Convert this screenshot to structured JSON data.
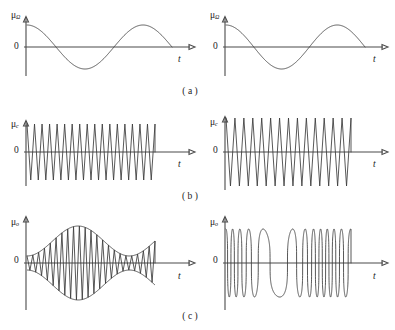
{
  "figure": {
    "width": 395,
    "height": 330,
    "background_color": "#ffffff",
    "line_color": "#3a3a3a",
    "axis_color": "#4a4a4a"
  },
  "labels": {
    "mu_base": "μ",
    "mu_sub_modulating": "Ω",
    "mu_sub_carrier": "c",
    "mu_sub_output": "o",
    "zero": "0",
    "time_axis": "t"
  },
  "rows": [
    {
      "key": "a",
      "caption": "( a )",
      "description": "modulating signal"
    },
    {
      "key": "b",
      "caption": "( b )",
      "description": "carrier signal"
    },
    {
      "key": "c",
      "caption": "( c )",
      "description": "modulated output signal"
    }
  ],
  "panels": [
    {
      "id": "a-left",
      "row": "a",
      "column": "left",
      "mu_label": "μ",
      "mu_subscript": "Ω",
      "zero_label": "0",
      "t_label": "t"
    },
    {
      "id": "a-right",
      "row": "a",
      "column": "right",
      "mu_label": "μ",
      "mu_subscript": "Ω",
      "zero_label": "0",
      "t_label": "t"
    },
    {
      "id": "b-left",
      "row": "b",
      "column": "left",
      "mu_label": "μ",
      "mu_subscript": "c",
      "zero_label": "0",
      "t_label": "t"
    },
    {
      "id": "b-right",
      "row": "b",
      "column": "right",
      "mu_label": "μ",
      "mu_subscript": "c",
      "zero_label": "0",
      "t_label": "t"
    },
    {
      "id": "c-left",
      "row": "c",
      "column": "left",
      "mu_label": "μ",
      "mu_subscript": "o",
      "zero_label": "0",
      "t_label": "t"
    },
    {
      "id": "c-right",
      "row": "c",
      "column": "right",
      "mu_label": "μ",
      "mu_subscript": "o",
      "zero_label": "0",
      "t_label": "t"
    }
  ],
  "chart_data": [
    {
      "id": "a-left",
      "type": "line",
      "title": "",
      "xlabel": "t",
      "ylabel": "μΩ",
      "waveform": "cosine",
      "amplitude": 1.0,
      "cycles": 1.25,
      "phase": 0,
      "grid": false,
      "xlim": [
        0,
        1.25
      ],
      "ylim": [
        -1.1,
        1.1
      ],
      "signal_role": "modulating signal"
    },
    {
      "id": "a-right",
      "type": "line",
      "title": "",
      "xlabel": "t",
      "ylabel": "μΩ",
      "waveform": "cosine",
      "amplitude": 1.0,
      "cycles": 1.25,
      "phase": 0,
      "grid": false,
      "xlim": [
        0,
        1.25
      ],
      "ylim": [
        -1.1,
        1.1
      ],
      "signal_role": "modulating signal"
    },
    {
      "id": "b-left",
      "type": "line",
      "title": "",
      "xlabel": "t",
      "ylabel": "μc",
      "waveform": "cosine",
      "amplitude": 1.0,
      "cycles": 17,
      "phase": 0,
      "grid": false,
      "xlim": [
        0,
        17
      ],
      "ylim": [
        -1.1,
        1.1
      ],
      "signal_role": "carrier signal, constant amplitude and frequency"
    },
    {
      "id": "b-right",
      "type": "line",
      "title": "",
      "xlabel": "t",
      "ylabel": "μc",
      "waveform": "cosine",
      "amplitude": 1.3,
      "cycles": 14,
      "phase": 0,
      "grid": false,
      "xlim": [
        0,
        14
      ],
      "ylim": [
        -1.4,
        1.4
      ],
      "signal_role": "carrier signal, constant amplitude and frequency"
    },
    {
      "id": "c-left",
      "type": "line",
      "title": "",
      "xlabel": "t",
      "ylabel": "μo",
      "waveform": "amplitude-modulated",
      "carrier_cycles": 22,
      "envelope_cycles": 1.25,
      "modulation_index": 0.68,
      "carrier_amplitude": 1.0,
      "grid": false,
      "xlim": [
        0,
        1.25
      ],
      "ylim": [
        -1.75,
        1.75
      ],
      "signal_role": "amplitude modulation (AM) output",
      "show_envelope": true
    },
    {
      "id": "c-right",
      "type": "line",
      "title": "",
      "xlabel": "t",
      "ylabel": "μo",
      "waveform": "frequency-modulated",
      "center_cycles": 11,
      "envelope_cycles": 1.25,
      "frequency_deviation": 0.72,
      "carrier_amplitude": 1.0,
      "grid": false,
      "xlim": [
        0,
        1.25
      ],
      "ylim": [
        -1.2,
        1.2
      ],
      "signal_role": "frequency modulation (FM) output",
      "show_envelope": false
    }
  ]
}
